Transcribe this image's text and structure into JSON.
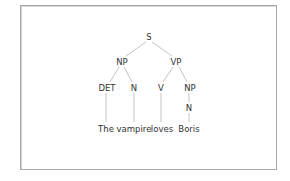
{
  "diagram": {
    "type": "syntax-tree",
    "nodes": {
      "s": "S",
      "np": "NP",
      "vp": "VP",
      "det": "DET",
      "n1": "N",
      "v": "V",
      "np2": "NP",
      "n2": "N"
    },
    "words": {
      "w1": "The",
      "w2": "vampire",
      "w3": "loves",
      "w4": "Boris"
    },
    "edges": [
      [
        "S",
        "NP"
      ],
      [
        "S",
        "VP"
      ],
      [
        "NP",
        "DET"
      ],
      [
        "NP",
        "N"
      ],
      [
        "VP",
        "V"
      ],
      [
        "VP",
        "NP"
      ],
      [
        "NP",
        "N"
      ],
      [
        "DET",
        "The"
      ],
      [
        "N",
        "vampire"
      ],
      [
        "V",
        "loves"
      ],
      [
        "N",
        "Boris"
      ]
    ],
    "colors": {
      "text": "#333333",
      "edge": "#c4c4c4",
      "border": "#a8a8a8"
    }
  }
}
